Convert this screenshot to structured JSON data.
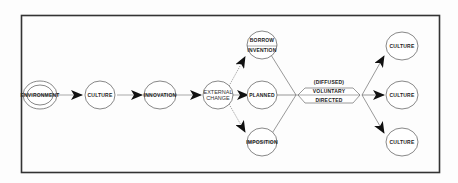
{
  "diagram": {
    "type": "flow",
    "frame": {
      "stroke": "#333333"
    },
    "colors": {
      "stroke": "#444444",
      "arrow": "#111111",
      "text": "#222222",
      "background": "#fdfdfd"
    },
    "nodes": {
      "environment": {
        "label": "ENVIRONMENT",
        "shape": "double-ellipse"
      },
      "culture_start": {
        "label": "CULTURE"
      },
      "innovation": {
        "label": "INNOVATION"
      },
      "external_change": {
        "line1": "EXTERNAL",
        "line2": "CHANGE"
      },
      "borrow_invention": {
        "line1": "BORROW",
        "line2": "INVENTION"
      },
      "planned": {
        "label": "PLANNED"
      },
      "imposition": {
        "label": "IMPOSITION"
      },
      "diffusion_box": {
        "line1": "(DIFFUSED)",
        "line2": "VOLUNTARY",
        "line3": "DIRECTED",
        "shape": "hexagon"
      },
      "culture_top": {
        "label": "CULTURE"
      },
      "culture_mid": {
        "label": "CULTURE"
      },
      "culture_bottom": {
        "label": "CULTURE"
      }
    },
    "edges": [
      {
        "from": "environment",
        "to": "culture_start",
        "style": "solid-arrow"
      },
      {
        "from": "culture_start",
        "to": "innovation",
        "style": "solid-arrow"
      },
      {
        "from": "innovation",
        "to": "external_change",
        "style": "solid-arrow"
      },
      {
        "from": "external_change",
        "to": "borrow_invention",
        "style": "dotted-arrow"
      },
      {
        "from": "external_change",
        "to": "planned",
        "style": "solid-arrow"
      },
      {
        "from": "external_change",
        "to": "imposition",
        "style": "dotted-arrow"
      },
      {
        "from": "borrow_invention",
        "to": "diffusion_box",
        "style": "line"
      },
      {
        "from": "planned",
        "to": "diffusion_box",
        "style": "line"
      },
      {
        "from": "imposition",
        "to": "diffusion_box",
        "style": "line"
      },
      {
        "from": "diffusion_box",
        "to": "culture_top",
        "style": "solid-arrow"
      },
      {
        "from": "diffusion_box",
        "to": "culture_mid",
        "style": "solid-arrow"
      },
      {
        "from": "diffusion_box",
        "to": "culture_bottom",
        "style": "solid-arrow"
      }
    ]
  }
}
